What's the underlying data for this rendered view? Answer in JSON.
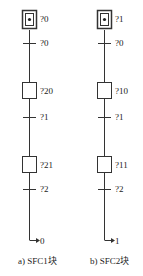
{
  "diagrams": [
    {
      "caption": "a) SFC1块",
      "initial_step": "?0",
      "transitions": [
        "?0",
        "?1",
        "?2"
      ],
      "steps": [
        "?20",
        "?21"
      ],
      "jump_target": "0"
    },
    {
      "caption": "b) SFC2块",
      "initial_step": "?1",
      "transitions": [
        "?0",
        "?1",
        "?2"
      ],
      "steps": [
        "?10",
        "?11"
      ],
      "jump_target": "1"
    }
  ],
  "colors": {
    "line": "#333333",
    "background": "#ffffff"
  }
}
